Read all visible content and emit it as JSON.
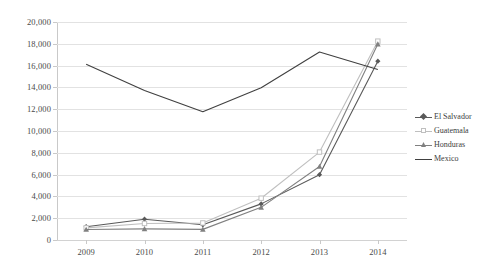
{
  "chart_data": {
    "type": "line",
    "title": "",
    "subtitle": "",
    "xlabel": "",
    "ylabel": "",
    "categories": [
      "2009",
      "2010",
      "2011",
      "2012",
      "2013",
      "2014"
    ],
    "x": [
      2009,
      2010,
      2011,
      2012,
      2013,
      2014
    ],
    "ylim": [
      0,
      20000
    ],
    "ytick_step": 2000,
    "ytick_labels": [
      "0",
      "2,000",
      "4,000",
      "6,000",
      "8,000",
      "10,000",
      "12,000",
      "14,000",
      "16,000",
      "18,000",
      "20,000"
    ],
    "ytick_values": [
      0,
      2000,
      4000,
      6000,
      8000,
      10000,
      12000,
      14000,
      16000,
      18000,
      20000
    ],
    "grid": true,
    "grid_axis": "y",
    "legend_position": "right",
    "series": [
      {
        "name": "El Salvador",
        "color": "#595959",
        "marker": "diamond",
        "values": [
          1221,
          1910,
          1394,
          3314,
          5990,
          16404
        ]
      },
      {
        "name": "Guatemala",
        "color": "#bfbfbf",
        "marker": "square",
        "values": [
          1115,
          1516,
          1565,
          3835,
          8068,
          18244
        ]
      },
      {
        "name": "Honduras",
        "color": "#808080",
        "marker": "triangle",
        "values": [
          968,
          1017,
          974,
          2997,
          6747,
          17975
        ]
      },
      {
        "name": "Mexico",
        "color": "#404040",
        "marker": "none",
        "values": [
          16114,
          13724,
          11768,
          13974,
          17240,
          15634
        ]
      }
    ]
  }
}
